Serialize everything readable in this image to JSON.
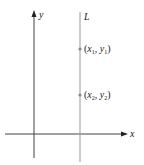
{
  "diagram": {
    "type": "coordinate-plane",
    "axes": {
      "x_label": "x",
      "y_label": "y"
    },
    "line": {
      "label": "L",
      "orientation": "vertical"
    },
    "points": [
      {
        "label": "(x1, y1)",
        "x": "x",
        "xsub": "1",
        "y": "y",
        "ysub": "1"
      },
      {
        "label": "(x2, y2)",
        "x": "x",
        "xsub": "2",
        "y": "y",
        "ysub": "2"
      }
    ],
    "colors": {
      "axis": "#333333",
      "line": "#888888",
      "point": "#888888",
      "background": "#ffffff"
    }
  }
}
